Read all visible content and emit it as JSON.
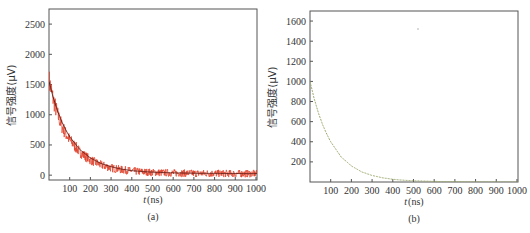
{
  "chart_data": [
    {
      "type": "line",
      "panel": "(a)",
      "title": "",
      "xlabel": "t (ns)",
      "ylabel": "信号强度(μV)",
      "xlim": [
        0,
        1005
      ],
      "ylim": [
        -80,
        2750
      ],
      "xticks": [
        100,
        200,
        300,
        400,
        500,
        600,
        700,
        800,
        900,
        1000
      ],
      "yticks": [
        0,
        500,
        1000,
        1500,
        2000,
        2500
      ],
      "grid": false,
      "series": [
        {
          "name": "measured (noisy)",
          "color": "#e0402a",
          "x": [
            0,
            20,
            40,
            60,
            80,
            100,
            150,
            200,
            250,
            300,
            350,
            400,
            450,
            500,
            600,
            700,
            800,
            900,
            1000
          ],
          "values": [
            1580,
            1260,
            1020,
            830,
            690,
            580,
            380,
            250,
            170,
            120,
            90,
            70,
            55,
            45,
            35,
            30,
            28,
            26,
            25
          ]
        },
        {
          "name": "fit",
          "color": "#5a1a12",
          "x": [
            0,
            20,
            40,
            60,
            80,
            100,
            150,
            200,
            250,
            300,
            350,
            400,
            450,
            500,
            600,
            700,
            800,
            900,
            1000
          ],
          "values": [
            1550,
            1290,
            1075,
            900,
            755,
            635,
            420,
            285,
            195,
            140,
            100,
            75,
            60,
            50,
            38,
            32,
            29,
            27,
            26
          ]
        }
      ]
    },
    {
      "type": "line",
      "panel": "(b)",
      "title": "",
      "xlabel": "t (ns)",
      "ylabel": "信号强度(μV)",
      "xlim": [
        0,
        1005
      ],
      "ylim": [
        0,
        1700
      ],
      "xticks": [
        100,
        200,
        300,
        400,
        500,
        600,
        700,
        800,
        900,
        1000
      ],
      "yticks": [
        200,
        400,
        600,
        800,
        1000,
        1200,
        1400,
        1600
      ],
      "grid": false,
      "series": [
        {
          "name": "signal",
          "color": "#9aa86a",
          "x": [
            0,
            20,
            40,
            60,
            80,
            100,
            150,
            200,
            250,
            300,
            350,
            400,
            450,
            500,
            600,
            700,
            800,
            900,
            1000
          ],
          "values": [
            1000,
            830,
            690,
            575,
            480,
            400,
            250,
            160,
            100,
            65,
            42,
            27,
            18,
            12,
            6,
            3,
            2,
            1,
            1
          ]
        }
      ]
    }
  ],
  "panels": {
    "a": {
      "caption": "(a)",
      "xlabel_var": "t",
      "xlabel_unit": "(ns)",
      "ylabel": "信号强度(μV)",
      "yticks": [
        "0",
        "500",
        "1000",
        "1500",
        "2000",
        "2500"
      ],
      "xticks": [
        "100",
        "200",
        "300",
        "400",
        "500",
        "600",
        "700",
        "800",
        "900",
        "1000"
      ]
    },
    "b": {
      "caption": "(b)",
      "xlabel_var": "t",
      "xlabel_unit": "(ns)",
      "ylabel": "信号强度(μV)",
      "yticks": [
        "200",
        "400",
        "600",
        "800",
        "1000",
        "1200",
        "1400",
        "1600"
      ],
      "xticks": [
        "100",
        "200",
        "300",
        "400",
        "500",
        "600",
        "700",
        "800",
        "900",
        "1000"
      ]
    }
  }
}
